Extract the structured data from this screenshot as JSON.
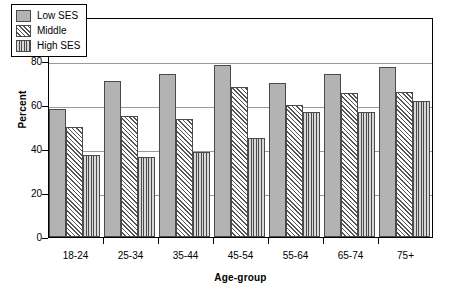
{
  "chart_data": {
    "type": "bar",
    "title": "",
    "subtitle": "",
    "xlabel": "Age-group",
    "ylabel": "Percent",
    "categories": [
      "18-24",
      "25-34",
      "35-44",
      "45-54",
      "55-64",
      "65-74",
      "75+"
    ],
    "series": [
      {
        "name": "Low SES",
        "pattern": "solid-gray",
        "color": "#b3b3b3",
        "values": [
          58,
          71,
          74,
          78,
          70,
          74,
          77.5
        ]
      },
      {
        "name": "Middle",
        "pattern": "diagonal-hatch",
        "color": "#ffffff",
        "values": [
          50,
          55,
          53.5,
          68,
          60,
          65.5,
          66
        ]
      },
      {
        "name": "High SES",
        "pattern": "vertical-lines",
        "color": "#d8d8d8",
        "values": [
          37.5,
          36.5,
          38.5,
          45,
          57,
          57,
          62
        ]
      }
    ],
    "ylim": [
      0,
      100
    ],
    "yticks": [
      0,
      20,
      40,
      60,
      80,
      100
    ],
    "ytick_labels": [
      "0",
      "20",
      "40",
      "60",
      "80",
      "100"
    ],
    "grid": true,
    "grid_axis": "y",
    "legend_position": "top-left-inside"
  },
  "legend": {
    "items": [
      {
        "label": "Low SES"
      },
      {
        "label": "Middle"
      },
      {
        "label": "High SES"
      }
    ]
  }
}
